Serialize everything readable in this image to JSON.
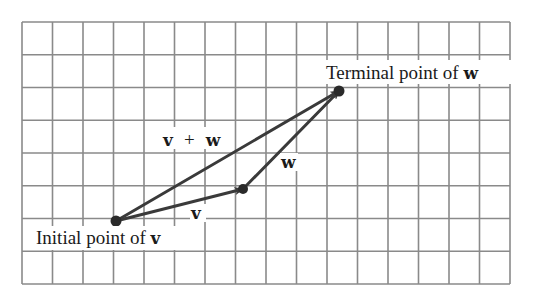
{
  "figure": {
    "grid": {
      "columns": 16,
      "rows": 8,
      "left": 22,
      "top": 22,
      "right": 510,
      "bottom": 284,
      "line_color": "#8a8a8a"
    },
    "points": {
      "initial_v": {
        "x": 116,
        "y": 221
      },
      "terminal_v_initial_w": {
        "x": 243,
        "y": 189
      },
      "terminal_w": {
        "x": 339,
        "y": 91
      }
    },
    "vectors": [
      {
        "name": "v",
        "from": "initial_v",
        "to": "terminal_v_initial_w"
      },
      {
        "name": "w",
        "from": "terminal_v_initial_w",
        "to": "terminal_w"
      },
      {
        "name": "v + w",
        "from": "initial_v",
        "to": "terminal_w"
      }
    ],
    "labels": {
      "sum_v": "v",
      "sum_plus": "+",
      "sum_w": "w",
      "w_vector": "w",
      "v_vector": "v",
      "terminal_prefix": "Terminal point of ",
      "terminal_var": "w",
      "initial_prefix": "Initial point of ",
      "initial_var": "v"
    },
    "vector_color": "#3a3a3a"
  }
}
